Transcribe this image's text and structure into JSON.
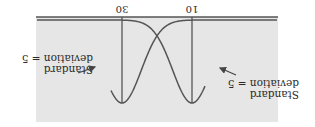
{
  "figure": {
    "orientation": "rotated-180",
    "background_color": "#e6e6e6",
    "line_color": "#555555",
    "axis": {
      "ticks": [
        {
          "value": "10",
          "label": "10"
        },
        {
          "value": "30",
          "label": "30"
        }
      ]
    },
    "curves": [
      {
        "name": "distribution-mean-10",
        "mean": 10,
        "std_dev": 5
      },
      {
        "name": "distribution-mean-30",
        "mean": 30,
        "std_dev": 5
      }
    ],
    "annotations": [
      {
        "line1": "Standard",
        "line2": "deviation = 5",
        "target": "distribution-mean-10"
      },
      {
        "line1": "Standard",
        "line2": "deviation = 5",
        "target": "distribution-mean-30"
      }
    ]
  }
}
